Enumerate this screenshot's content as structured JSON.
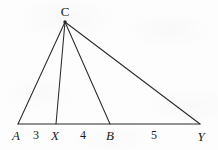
{
  "figure": {
    "kind": "geometry-diagram",
    "width": 218,
    "height": 150,
    "stroke_color": "#2a2a2a",
    "background_color": "#fdfdfd"
  },
  "points": {
    "A": {
      "label": "A",
      "x": 18,
      "y": 124,
      "label_x": 16,
      "label_y": 135
    },
    "X": {
      "label": "X",
      "x": 56,
      "y": 124,
      "label_x": 55,
      "label_y": 135
    },
    "B": {
      "label": "B",
      "x": 110,
      "y": 124,
      "label_x": 110,
      "label_y": 135
    },
    "Y": {
      "label": "Y",
      "x": 200,
      "y": 124,
      "label_x": 201,
      "label_y": 136
    },
    "C": {
      "label": "C",
      "x": 65,
      "y": 22,
      "label_x": 65,
      "label_y": 11
    }
  },
  "segment_lengths": [
    {
      "label": "3",
      "from": "A",
      "to": "X",
      "label_x": 36,
      "label_y": 135
    },
    {
      "label": "4",
      "from": "X",
      "to": "B",
      "label_x": 83,
      "label_y": 135
    },
    {
      "label": "5",
      "from": "B",
      "to": "Y",
      "label_x": 154,
      "label_y": 135
    }
  ],
  "segments": [
    {
      "name": "baseline-A-Y",
      "from": "A",
      "to": "Y"
    },
    {
      "name": "cevian-C-A",
      "from": "C",
      "to": "A"
    },
    {
      "name": "cevian-C-X",
      "from": "C",
      "to": "X"
    },
    {
      "name": "cevian-C-B",
      "from": "C",
      "to": "B"
    },
    {
      "name": "cevian-C-Y",
      "from": "C",
      "to": "Y"
    }
  ]
}
